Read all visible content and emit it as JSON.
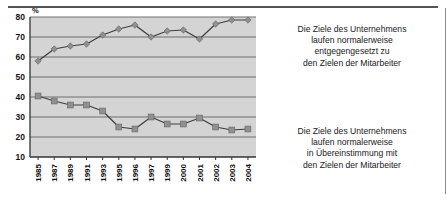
{
  "chart_data": {
    "type": "line",
    "title": "",
    "subtitle": "",
    "xlabel": "",
    "ylabel": "%",
    "ylim": [
      10,
      80
    ],
    "ytick_values": [
      10,
      20,
      30,
      40,
      50,
      60,
      70,
      80
    ],
    "ytick_labels": [
      "10",
      "20",
      "30",
      "40",
      "50",
      "60",
      "70",
      "80"
    ],
    "grid": true,
    "legend_position": "right-annotations",
    "categories": [
      "1985",
      "1987",
      "1989",
      "1991",
      "1993",
      "1995",
      "1996",
      "1997",
      "1999",
      "2000",
      "2001",
      "2002",
      "2003",
      "2004"
    ],
    "series": [
      {
        "name": "Die Ziele des Unternehmens laufen normalerweise entgegengesetzt zu den Zielen der Mitarbeiter",
        "marker": "diamond",
        "color": "#808080",
        "values": [
          58,
          64,
          65.5,
          66.5,
          71,
          74,
          76,
          70,
          73,
          73.5,
          69,
          76.5,
          78.5,
          78.5
        ]
      },
      {
        "name": "Die Ziele des Unternehmens laufen normalerweise in Übereinstimmung mit den Zielen der Mitarbeiter",
        "marker": "square",
        "color": "#808080",
        "values": [
          40.5,
          38,
          36,
          36,
          33,
          25,
          24,
          30,
          26.5,
          26.5,
          29.5,
          25,
          23.5,
          24
        ]
      }
    ],
    "annotations": [
      {
        "id": "top",
        "lines": [
          "Die Ziele des Unternehmens",
          "laufen normalerweise",
          "entgegengesetzt zu",
          "den Zielen der Mitarbeiter"
        ]
      },
      {
        "id": "bottom",
        "lines": [
          "Die Ziele des Unternehmens",
          "laufen normalerweise",
          "in Übereinstimmung mit",
          "den Zielen der Mitarbeiter"
        ]
      }
    ],
    "colors": {
      "plot_background": "#d4d4d4",
      "gridline": "#6e6e6e",
      "axis": "#333333",
      "line": "#3c3c3c",
      "marker": "#909090",
      "text": "#111111",
      "rule": "#555555"
    }
  },
  "annotation_top": {
    "line1": "Die Ziele des Unternehmens",
    "line2": "laufen normalerweise",
    "line3": "entgegengesetzt zu",
    "line4": "den Zielen der Mitarbeiter"
  },
  "annotation_bottom": {
    "line1": "Die Ziele des Unternehmens",
    "line2": "laufen normalerweise",
    "line3": "in Übereinstimmung mit",
    "line4": "den Zielen der Mitarbeiter"
  }
}
